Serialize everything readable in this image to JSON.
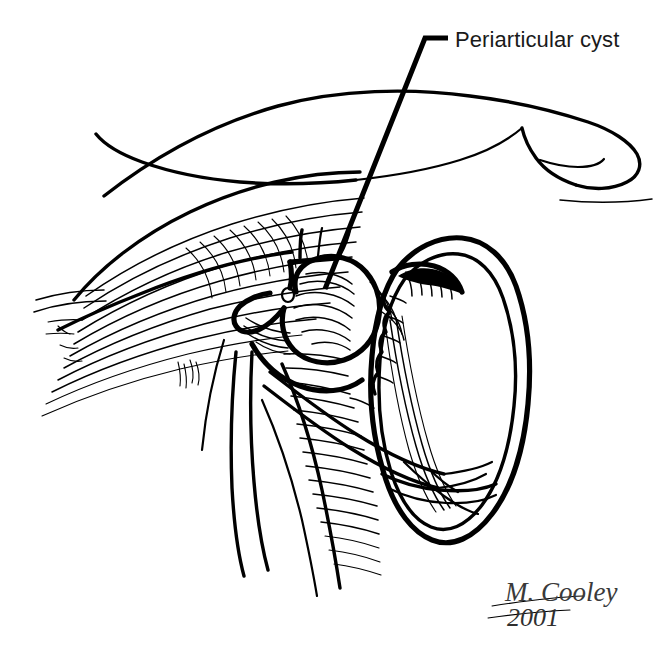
{
  "figure": {
    "title": "Periarticular cyst",
    "medium": "pen-and-ink line drawing",
    "background_color": "#ffffff",
    "ink_color": "#000000"
  },
  "annotations": [
    {
      "id": "periarticular-cyst",
      "label": "Periarticular cyst",
      "label_x": 455,
      "label_y": 47,
      "leader_points": "448,38 425,38 325,289",
      "target_x": 325,
      "target_y": 289
    }
  ],
  "signature": {
    "name": "M. Cooley",
    "year": "2001",
    "name_x": 505,
    "name_y": 601,
    "year_x": 507,
    "year_y": 626,
    "color": "#3a3a3a"
  },
  "anatomy": {
    "structures": [
      {
        "name": "retracted-skin-flap",
        "description": "upper elongated tissue flap with rounded tip at right"
      },
      {
        "name": "muscle-belly-upper",
        "description": "hatched muscle mass below the flap"
      },
      {
        "name": "periarticular-cyst-body",
        "description": "rounded lobulated cyst at center of field"
      },
      {
        "name": "joint-capsule-oval",
        "description": "large ovoid joint surface at right with layered retracted margins"
      },
      {
        "name": "tendon-band-lower",
        "description": "paired tendon/ligament bands crossing lower field"
      },
      {
        "name": "vessel-strand",
        "description": "thin strand descending to lower left"
      }
    ]
  }
}
